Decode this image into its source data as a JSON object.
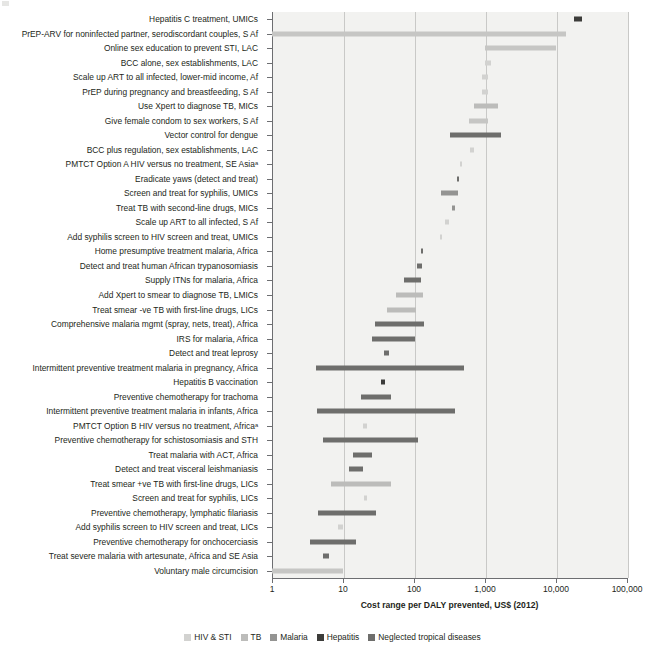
{
  "chart_data": {
    "type": "bar",
    "orientation": "horizontal",
    "subtype": "range-bars",
    "title": "",
    "xlabel": "Cost range per DALY prevented, US$ (2012)",
    "ylabel": "",
    "xscale": "log",
    "xlim": [
      1,
      100000
    ],
    "xticks": [
      1,
      10,
      100,
      1000,
      10000,
      100000
    ],
    "xticklabels": [
      "1",
      "10",
      "100",
      "1,000",
      "10,000",
      "100,000"
    ],
    "grid": "vertical",
    "legend_position": "bottom",
    "legend": [
      {
        "name": "HIV & STI",
        "color": "#d2d2d0"
      },
      {
        "name": "TB",
        "color": "#bcbcba"
      },
      {
        "name": "Malaria",
        "color": "#949492"
      },
      {
        "name": "Hepatitis",
        "color": "#3c3c3a"
      },
      {
        "name": "Neglected tropical diseases",
        "color": "#6e6e6c"
      }
    ],
    "footnote_marker": "a",
    "categories": [
      "Hepatitis C treatment, UMICs",
      "PrEP-ARV for noninfected partner, serodiscordant couples, S Af",
      "Online sex education to prevent STI, LAC",
      "BCC alone, sex establishments, LAC",
      "Scale up ART to all infected, lower-mid income, Af",
      "PrEP during pregnancy and breastfeeding, S Af",
      "Use Xpert to diagnose TB, MICs",
      "Give female condom to sex workers, S Af",
      "Vector control for dengue",
      "BCC plus regulation, sex establishments, LAC",
      "PMTCT Option A HIV versus no treatment, SE Asiaᵃ",
      "Eradicate yaws (detect and treat)",
      "Screen and treat for syphilis, UMICs",
      "Treat TB with second-line drugs, MICs",
      "Scale up ART to all infected, S Af",
      "Add syphilis screen to HIV screen and treat, UMICs",
      "Home presumptive treatment malaria, Africa",
      "Detect and treat human African trypanosomiasis",
      "Supply ITNs for malaria, Africa",
      "Add Xpert to smear to diagnose TB, LMICs",
      "Treat smear -ve TB with first-line drugs, LICs",
      "Comprehensive malaria mgmt (spray, nets, treat), Africa",
      "IRS for malaria, Africa",
      "Detect and treat leprosy",
      "Intermittent preventive treatment malaria in pregnancy, Africa",
      "Hepatitis B vaccination",
      "Preventive chemotherapy for trachoma",
      "Intermittent preventive treatment malaria in infants, Africa",
      "PMTCT Option B HIV versus no treatment, Africaᵃ",
      "Preventive chemotherapy for schistosomiasis and STH",
      "Treat malaria with ACT, Africa",
      "Detect and treat visceral leishmaniasis",
      "Treat smear +ve TB with first-line drugs, LICs",
      "Screen and treat for syphilis, LICs",
      "Preventive chemotherapy, lymphatic filariasis",
      "Add syphilis screen to HIV screen and treat, LICs",
      "Preventive chemotherapy for onchocerciasis",
      "Treat severe malaria with artesunate, Africa and SE Asia",
      "Voluntary male circumcision"
    ],
    "bars": [
      {
        "label": "Hepatitis C treatment, UMICs",
        "group": "Hepatitis",
        "color": "#3c3c3a",
        "low": 18000,
        "high": 23000
      },
      {
        "label": "PrEP-ARV for noninfected partner, serodiscordant couples, S Af",
        "group": "HIV & STI",
        "color": "#c6c6c4",
        "low": 1,
        "high": 14000
      },
      {
        "label": "Online sex education to prevent STI, LAC",
        "group": "HIV & STI",
        "color": "#c6c6c4",
        "low": 1000,
        "high": 10000
      },
      {
        "label": "BCC alone, sex establishments, LAC",
        "group": "HIV & STI",
        "color": "#d2d2d0",
        "low": 1000,
        "high": 1200
      },
      {
        "label": "Scale up ART to all infected, lower-mid income, Af",
        "group": "HIV & STI",
        "color": "#d2d2d0",
        "low": 900,
        "high": 1100
      },
      {
        "label": "PrEP during pregnancy and breastfeeding, S Af",
        "group": "HIV & STI",
        "color": "#d2d2d0",
        "low": 900,
        "high": 1100
      },
      {
        "label": "Use Xpert to diagnose TB, MICs",
        "group": "TB",
        "color": "#bcbcba",
        "low": 700,
        "high": 1500
      },
      {
        "label": "Give female condom to sex workers, S Af",
        "group": "HIV & STI",
        "color": "#c6c6c4",
        "low": 600,
        "high": 1100
      },
      {
        "label": "Vector control for dengue",
        "group": "Neglected tropical diseases",
        "color": "#6e6e6c",
        "low": 320,
        "high": 1700
      },
      {
        "label": "BCC plus regulation, sex establishments, LAC",
        "group": "HIV & STI",
        "color": "#d2d2d0",
        "low": 620,
        "high": 700
      },
      {
        "label": "PMTCT Option A HIV versus no treatment, SE Asia",
        "group": "HIV & STI",
        "color": "#d2d2d0",
        "low": 440,
        "high": 480
      },
      {
        "label": "Eradicate yaws (detect and treat)",
        "group": "Neglected tropical diseases",
        "color": "#6e6e6c",
        "low": 400,
        "high": 430
      },
      {
        "label": "Screen and treat for syphilis, UMICs",
        "group": "HIV & STI",
        "color": "#949492",
        "low": 240,
        "high": 420
      },
      {
        "label": "Treat TB with second-line drugs, MICs",
        "group": "TB",
        "color": "#949492",
        "low": 340,
        "high": 380
      },
      {
        "label": "Scale up ART to all infected, S Af",
        "group": "HIV & STI",
        "color": "#d2d2d0",
        "low": 270,
        "high": 310
      },
      {
        "label": "Add syphilis screen to HIV screen and treat, UMICs",
        "group": "HIV & STI",
        "color": "#d2d2d0",
        "low": 230,
        "high": 250
      },
      {
        "label": "Home presumptive treatment malaria, Africa",
        "group": "Malaria",
        "color": "#6e6e6c",
        "low": 125,
        "high": 135
      },
      {
        "label": "Detect and treat human African trypanosomiasis",
        "group": "Neglected tropical diseases",
        "color": "#6e6e6c",
        "low": 110,
        "high": 130
      },
      {
        "label": "Supply ITNs for malaria, Africa",
        "group": "Malaria",
        "color": "#6e6e6c",
        "low": 72,
        "high": 125
      },
      {
        "label": "Add Xpert to smear to diagnose TB, LMICs",
        "group": "TB",
        "color": "#bcbcba",
        "low": 55,
        "high": 135
      },
      {
        "label": "Treat smear -ve TB with first-line drugs, LICs",
        "group": "TB",
        "color": "#bcbcba",
        "low": 42,
        "high": 105
      },
      {
        "label": "Comprehensive malaria mgmt (spray, nets, treat), Africa",
        "group": "Malaria",
        "color": "#6e6e6c",
        "low": 28,
        "high": 140
      },
      {
        "label": "IRS for malaria, Africa",
        "group": "Malaria",
        "color": "#6e6e6c",
        "low": 26,
        "high": 105
      },
      {
        "label": "Detect and treat leprosy",
        "group": "Neglected tropical diseases",
        "color": "#6e6e6c",
        "low": 38,
        "high": 45
      },
      {
        "label": "Intermittent preventive treatment malaria in pregnancy, Africa",
        "group": "Malaria",
        "color": "#6e6e6c",
        "low": 4.2,
        "high": 510
      },
      {
        "label": "Hepatitis B vaccination",
        "group": "Hepatitis",
        "color": "#3c3c3a",
        "low": 34,
        "high": 39
      },
      {
        "label": "Preventive chemotherapy for trachoma",
        "group": "Neglected tropical diseases",
        "color": "#6e6e6c",
        "low": 18,
        "high": 48
      },
      {
        "label": "Intermittent preventive treatment malaria in infants, Africa",
        "group": "Malaria",
        "color": "#6e6e6c",
        "low": 4.3,
        "high": 380
      },
      {
        "label": "PMTCT Option B HIV versus no treatment, Africa",
        "group": "HIV & STI",
        "color": "#d2d2d0",
        "low": 19,
        "high": 22
      },
      {
        "label": "Preventive chemotherapy for schistosomiasis and STH",
        "group": "Neglected tropical diseases",
        "color": "#6e6e6c",
        "low": 5.2,
        "high": 115
      },
      {
        "label": "Treat malaria with ACT, Africa",
        "group": "Malaria",
        "color": "#6e6e6c",
        "low": 14,
        "high": 26
      },
      {
        "label": "Detect and treat visceral leishmaniasis",
        "group": "Neglected tropical diseases",
        "color": "#6e6e6c",
        "low": 12,
        "high": 19
      },
      {
        "label": "Treat smear +ve TB with first-line drugs, LICs",
        "group": "TB",
        "color": "#bcbcba",
        "low": 6.8,
        "high": 47
      },
      {
        "label": "Screen and treat for syphilis, LICs",
        "group": "HIV & STI",
        "color": "#d2d2d0",
        "low": 20,
        "high": 22
      },
      {
        "label": "Preventive chemotherapy, lymphatic filariasis",
        "group": "Neglected tropical diseases",
        "color": "#6e6e6c",
        "low": 4.5,
        "high": 29
      },
      {
        "label": "Add syphilis screen to HIV screen and treat, LICs",
        "group": "HIV & STI",
        "color": "#d2d2d0",
        "low": 8.5,
        "high": 10
      },
      {
        "label": "Preventive chemotherapy for onchocerciasis",
        "group": "Neglected tropical diseases",
        "color": "#6e6e6c",
        "low": 3.4,
        "high": 15
      },
      {
        "label": "Treat severe malaria with artesunate, Africa and SE Asia",
        "group": "Malaria",
        "color": "#6e6e6c",
        "low": 5.2,
        "high": 6.4
      },
      {
        "label": "Voluntary male circumcision",
        "group": "HIV & STI",
        "color": "#c6c6c4",
        "low": 1,
        "high": 10
      }
    ]
  }
}
